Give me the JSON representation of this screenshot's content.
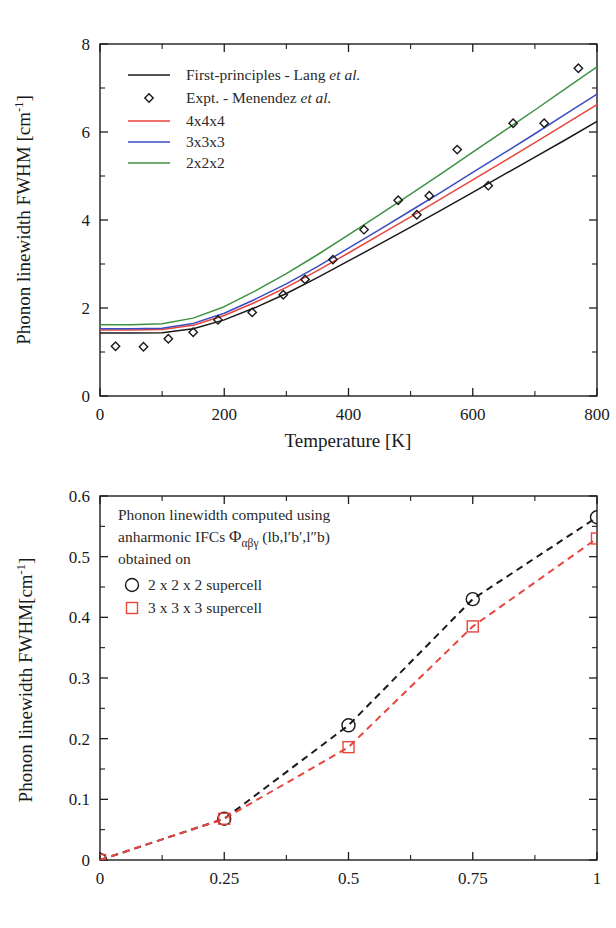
{
  "figure": {
    "name": "phonon-linewidth-figure"
  },
  "chart_data": [
    {
      "id": "top",
      "type": "line",
      "title": "",
      "xlabel": "Temperature [K]",
      "ylabel": "Phonon linewidth  FWHM [cm-1]",
      "ylabel_main": "Phonon linewidth  FWHM [cm",
      "ylabel_sup": "-1",
      "ylabel_tail": "]",
      "xlim": [
        0,
        800
      ],
      "ylim": [
        0,
        8
      ],
      "xticks": [
        0,
        200,
        400,
        600,
        800
      ],
      "xticklabels": [
        "0",
        "200",
        "400",
        "600",
        "800"
      ],
      "xminor": [
        100,
        300,
        500,
        700
      ],
      "yticks": [
        0,
        2,
        4,
        6,
        8
      ],
      "yticklabels": [
        "0",
        "2",
        "4",
        "6",
        "8"
      ],
      "yminor": [
        1,
        3,
        5,
        7
      ],
      "grid": false,
      "legend_position": "upper-left",
      "legend": [
        {
          "label": "First-principles - Lang ",
          "italic": "et al.",
          "color": "#1a1a1a",
          "marker": "line"
        },
        {
          "label": "Expt. - Menendez ",
          "italic": "et al.",
          "color": "#1a1a1a",
          "marker": "diamond"
        },
        {
          "label": "4x4x4",
          "italic": "",
          "color": "#e8453c",
          "marker": "line"
        },
        {
          "label": "3x3x3",
          "italic": "",
          "color": "#3b4cc0",
          "marker": "line"
        },
        {
          "label": "2x2x2",
          "italic": "",
          "color": "#3f9142",
          "marker": "line"
        }
      ],
      "series": [
        {
          "name": "First-principles - Lang et al.",
          "color": "#1a1a1a",
          "style": "solid",
          "x": [
            0,
            50,
            100,
            150,
            200,
            250,
            300,
            350,
            400,
            450,
            500,
            550,
            600,
            650,
            700,
            750,
            800
          ],
          "values": [
            1.43,
            1.43,
            1.44,
            1.53,
            1.73,
            2.01,
            2.33,
            2.69,
            3.07,
            3.45,
            3.84,
            4.23,
            4.63,
            5.03,
            5.43,
            5.83,
            6.24
          ]
        },
        {
          "name": "4x4x4",
          "color": "#e8453c",
          "style": "solid",
          "x": [
            0,
            50,
            100,
            150,
            200,
            250,
            300,
            350,
            400,
            450,
            500,
            550,
            600,
            650,
            700,
            750,
            800
          ],
          "values": [
            1.5,
            1.5,
            1.51,
            1.61,
            1.83,
            2.13,
            2.47,
            2.85,
            3.25,
            3.66,
            4.07,
            4.49,
            4.91,
            5.33,
            5.76,
            6.19,
            6.62
          ]
        },
        {
          "name": "3x3x3",
          "color": "#3b4cc0",
          "style": "solid",
          "x": [
            0,
            50,
            100,
            150,
            200,
            250,
            300,
            350,
            400,
            450,
            500,
            550,
            600,
            650,
            700,
            750,
            800
          ],
          "values": [
            1.53,
            1.53,
            1.54,
            1.65,
            1.88,
            2.2,
            2.55,
            2.94,
            3.36,
            3.78,
            4.21,
            4.64,
            5.08,
            5.52,
            5.96,
            6.41,
            6.86
          ]
        },
        {
          "name": "2x2x2",
          "color": "#3f9142",
          "style": "solid",
          "x": [
            0,
            50,
            100,
            150,
            200,
            250,
            300,
            350,
            400,
            450,
            500,
            550,
            600,
            650,
            700,
            750,
            800
          ],
          "values": [
            1.62,
            1.62,
            1.64,
            1.77,
            2.03,
            2.39,
            2.78,
            3.21,
            3.66,
            4.12,
            4.59,
            5.06,
            5.54,
            6.02,
            6.5,
            6.99,
            7.48
          ]
        }
      ],
      "scatter": [
        {
          "name": "Expt. - Menendez et al.",
          "color": "#1a1a1a",
          "marker": "diamond",
          "x": [
            25,
            70,
            110,
            150,
            190,
            245,
            295,
            330,
            375,
            425,
            480,
            510,
            530,
            575,
            625,
            665,
            715,
            770
          ],
          "values": [
            1.13,
            1.12,
            1.3,
            1.45,
            1.73,
            1.9,
            2.3,
            2.65,
            3.1,
            3.78,
            4.45,
            4.12,
            4.55,
            5.6,
            4.78,
            6.2,
            6.2,
            7.45
          ]
        }
      ]
    },
    {
      "id": "bottom",
      "type": "line",
      "title": "",
      "xlabel": "",
      "ylabel": "Phonon linewidth FWHM[cm-1]",
      "ylabel_main": "Phonon linewidth FWHM[cm",
      "ylabel_sup": "-1",
      "ylabel_tail": "]",
      "xlim": [
        0,
        1
      ],
      "ylim": [
        0,
        0.6
      ],
      "xticks": [
        0,
        0.25,
        0.5,
        0.75,
        1
      ],
      "xticklabels": [
        "0",
        "0.25",
        "0.5",
        "0.75",
        "1"
      ],
      "xminor": [
        0.125,
        0.375,
        0.625,
        0.875
      ],
      "yticks": [
        0,
        0.1,
        0.2,
        0.3,
        0.4,
        0.5,
        0.6
      ],
      "yticklabels": [
        "0",
        "0.1",
        "0.2",
        "0.3",
        "0.4",
        "0.5",
        "0.6"
      ],
      "yminor": [
        0.05,
        0.15,
        0.25,
        0.35,
        0.45,
        0.55
      ],
      "grid": false,
      "annotation_lines": [
        "Phonon linewidth computed using",
        "anharmonic IFCs",
        "obtained on"
      ],
      "annotation_formula_base": "Φ",
      "annotation_formula_sub": "αβγ",
      "annotation_formula_rest": " (lb,l′b′,l″b)",
      "legend_position": "upper-left",
      "legend": [
        {
          "label": "2 x 2 x 2 supercell",
          "color": "#1a1a1a",
          "marker": "circle"
        },
        {
          "label": "3 x 3 x 3 supercell",
          "color": "#e8453c",
          "marker": "square"
        }
      ],
      "series": [
        {
          "name": "2 x 2 x 2 supercell",
          "color": "#1a1a1a",
          "style": "dashed",
          "marker": "circle",
          "x": [
            0,
            0.25,
            0.5,
            0.75,
            1
          ],
          "values": [
            0.0,
            0.068,
            0.222,
            0.43,
            0.565
          ]
        },
        {
          "name": "3 x 3 x 3 supercell",
          "color": "#e8453c",
          "style": "dashed",
          "marker": "square",
          "x": [
            0,
            0.25,
            0.5,
            0.75,
            1
          ],
          "values": [
            0.0,
            0.068,
            0.186,
            0.385,
            0.53
          ]
        }
      ]
    }
  ]
}
